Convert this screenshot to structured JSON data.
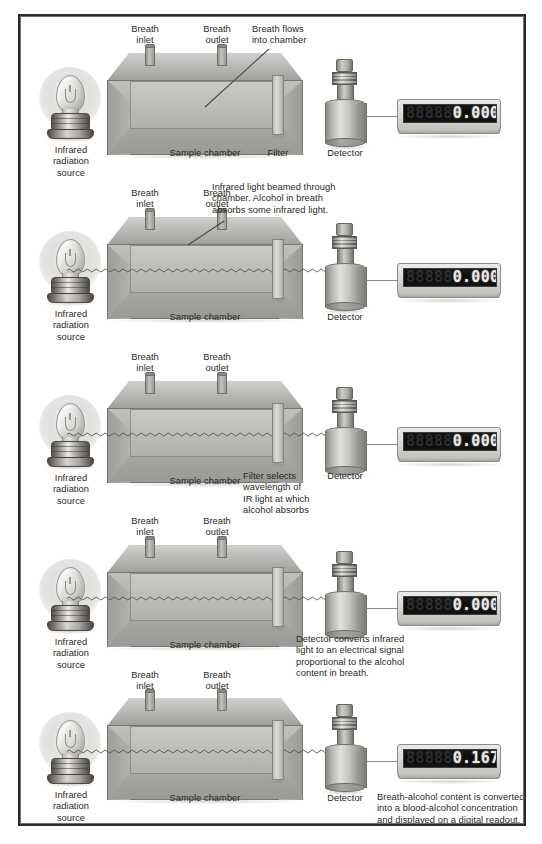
{
  "figure": {
    "border_color": "#2b2b2b",
    "background": "#ffffff"
  },
  "common_labels": {
    "ir_source": "Infrared\nradiation\nsource",
    "ir_source_line1": "Infrared",
    "ir_source_line2": "radiation",
    "ir_source_line3": "source",
    "breath_inlet_line1": "Breath",
    "breath_inlet_line2": "inlet",
    "breath_outlet_line1": "Breath",
    "breath_outlet_line2": "outlet",
    "sample_chamber": "Sample chamber",
    "filter": "Filter",
    "detector": "Detector"
  },
  "readouts": {
    "zero": "0.000",
    "result": "0.167",
    "dim_digits": "88888"
  },
  "panels": [
    {
      "id": "panel-1",
      "step": 1,
      "callout": "Breath flows\ninto chamber",
      "callout_line1": "Breath flows",
      "callout_line2": "into chamber",
      "show_beam": false,
      "show_filter_label": true,
      "readout_value": "0.000"
    },
    {
      "id": "panel-2",
      "step": 2,
      "callout": "Infrared light beamed through\nchamber. Alcohol in breath\nabsorbs some infrared light.",
      "callout_line1": "Infrared light beamed through",
      "callout_line2": "chamber. Alcohol in breath",
      "callout_line3": "absorbs some infrared light.",
      "show_beam": true,
      "show_filter_label": false,
      "readout_value": "0.000"
    },
    {
      "id": "panel-3",
      "step": 3,
      "callout": "Filter selects\nwavelength of\nIR light at which\nalcohol absorbs",
      "callout_line1": "Filter selects",
      "callout_line2": "wavelength of",
      "callout_line3": "IR light at which",
      "callout_line4": "alcohol absorbs",
      "show_beam": true,
      "show_filter_label": false,
      "readout_value": "0.000"
    },
    {
      "id": "panel-4",
      "step": 4,
      "callout": "Detector converts infrared\nlight to an electrical signal\nproportional to the alcohol\ncontent in breath.",
      "callout_line1": "Detector converts infrared",
      "callout_line2": "light to an electrical signal",
      "callout_line3": "proportional to the alcohol",
      "callout_line4": "content in breath.",
      "show_beam": true,
      "show_filter_label": false,
      "readout_value": "0.000"
    },
    {
      "id": "panel-5",
      "step": 5,
      "callout": "Breath-alcohol content is converted\ninto a blood-alcohol concentration\nand displayed on a digital readout.",
      "callout_line1": "Breath-alcohol content is converted",
      "callout_line2": "into a blood-alcohol concentration",
      "callout_line3": "and displayed on a digital readout.",
      "show_beam": true,
      "show_filter_label": false,
      "readout_value": "0.167"
    }
  ]
}
